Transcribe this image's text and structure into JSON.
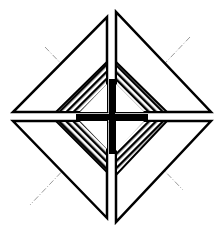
{
  "figure": {
    "colors": {
      "background": "#ffffff",
      "stroke": "#000000",
      "guide_lines": "#999999",
      "hatch": "#000000"
    },
    "elements": {
      "quadrants": [
        "top-left",
        "top-right",
        "bottom-left",
        "bottom-right"
      ],
      "center_symbol": "plus-cross",
      "guide_lines": "diagonal dash-dot lines crossing diamond"
    }
  }
}
